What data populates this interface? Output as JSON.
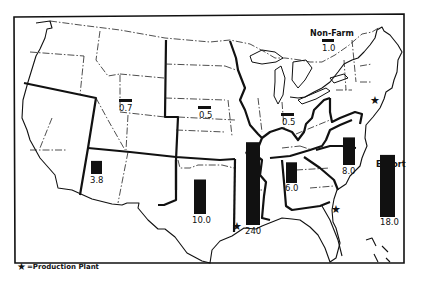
{
  "chart_data": {
    "type": "bar",
    "title": "",
    "regions": [
      {
        "name": "Mountain North",
        "label": "0.7",
        "value": 0.7
      },
      {
        "name": "Plains North",
        "label": "0.5",
        "value": 0.5
      },
      {
        "name": "Corn Belt",
        "label": "0.5",
        "value": 0.5
      },
      {
        "name": "Southwest",
        "label": "3.8",
        "value": 3.8
      },
      {
        "name": "Southern Plains",
        "label": "10.0",
        "value": 10.0
      },
      {
        "name": "Delta",
        "label": "240",
        "value": 24.0
      },
      {
        "name": "Southeast",
        "label": "6.0",
        "value": 6.0
      },
      {
        "name": "Appalachian",
        "label": "8.0",
        "value": 8.0
      },
      {
        "name": "Non-Farm",
        "label": "1.0",
        "value": 1.0
      },
      {
        "name": "Export",
        "label": "18.0",
        "value": 18.0
      }
    ],
    "annotations": [
      "Non-Farm",
      "Export"
    ],
    "legend": {
      "symbol": "star",
      "text": "=Production Plant",
      "placement": "bottom-left"
    },
    "production_plants": [
      "Lower Mississippi (Louisiana)",
      "Georgia coast",
      "New Jersey / New York"
    ]
  },
  "labels": {
    "non_farm": "Non-Farm",
    "export": "Export",
    "legend_text": "=Production Plant"
  }
}
